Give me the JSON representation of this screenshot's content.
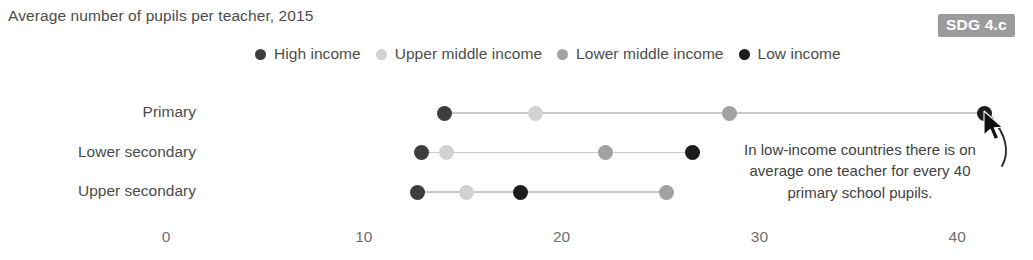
{
  "header": {
    "title": "Average number of pupils per teacher, 2015",
    "badge": "SDG 4.c"
  },
  "legend": {
    "position": "top-center",
    "items": [
      {
        "label": "High income",
        "color": "#3d3d3d",
        "dot": "legend-dot-high-income"
      },
      {
        "label": "Upper middle income",
        "color": "#d2d2d2",
        "dot": "legend-dot-upper-middle-income"
      },
      {
        "label": "Lower middle income",
        "color": "#a2a2a2",
        "dot": "legend-dot-lower-middle-income"
      },
      {
        "label": "Low income",
        "color": "#1c1c1c",
        "dot": "legend-dot-low-income"
      }
    ]
  },
  "annotation": {
    "text": "In low-income countries there is on average one teacher for every 40 primary school pupils.",
    "points_to": "Primary / Low income"
  },
  "chart_data": {
    "type": "scatter",
    "subtype": "dumbbell-dot-plot",
    "title": "Average number of pupils per teacher, 2015",
    "xlabel": "",
    "ylabel": "",
    "xlim": [
      0,
      42
    ],
    "xticks": [
      0,
      10,
      20,
      30,
      40
    ],
    "xticklabels": [
      "0",
      "10",
      "20",
      "30",
      "40"
    ],
    "grid": false,
    "categories": [
      "Primary",
      "Lower secondary",
      "Upper secondary"
    ],
    "series": [
      {
        "name": "High income",
        "color": "#3d3d3d",
        "values": [
          14.1,
          12.9,
          12.7
        ]
      },
      {
        "name": "Upper middle income",
        "color": "#d2d2d2",
        "values": [
          18.7,
          14.2,
          15.2
        ]
      },
      {
        "name": "Lower middle income",
        "color": "#a2a2a2",
        "values": [
          28.5,
          22.2,
          25.3
        ]
      },
      {
        "name": "Low income",
        "color": "#1c1c1c",
        "values": [
          41.4,
          26.6,
          17.9
        ]
      }
    ],
    "rows": [
      {
        "category": "Primary",
        "points": [
          {
            "series": "High income",
            "value": 14.1,
            "color": "#3d3d3d"
          },
          {
            "series": "Upper middle income",
            "value": 18.7,
            "color": "#d2d2d2"
          },
          {
            "series": "Lower middle income",
            "value": 28.5,
            "color": "#a2a2a2"
          },
          {
            "series": "Low income",
            "value": 41.4,
            "color": "#1c1c1c"
          }
        ]
      },
      {
        "category": "Lower secondary",
        "points": [
          {
            "series": "High income",
            "value": 12.9,
            "color": "#3d3d3d"
          },
          {
            "series": "Upper middle income",
            "value": 14.2,
            "color": "#d2d2d2"
          },
          {
            "series": "Lower middle income",
            "value": 22.2,
            "color": "#a2a2a2"
          },
          {
            "series": "Low income",
            "value": 26.6,
            "color": "#1c1c1c"
          }
        ]
      },
      {
        "category": "Upper secondary",
        "points": [
          {
            "series": "High income",
            "value": 12.7,
            "color": "#3d3d3d"
          },
          {
            "series": "Upper middle income",
            "value": 15.2,
            "color": "#d2d2d2"
          },
          {
            "series": "Low income",
            "value": 17.9,
            "color": "#1c1c1c"
          },
          {
            "series": "Lower middle income",
            "value": 25.3,
            "color": "#a2a2a2"
          }
        ]
      }
    ]
  },
  "axis": {
    "ticks": [
      "0",
      "10",
      "20",
      "30",
      "40"
    ]
  },
  "cursor": {
    "visible": true,
    "name": "mouse-pointer"
  }
}
